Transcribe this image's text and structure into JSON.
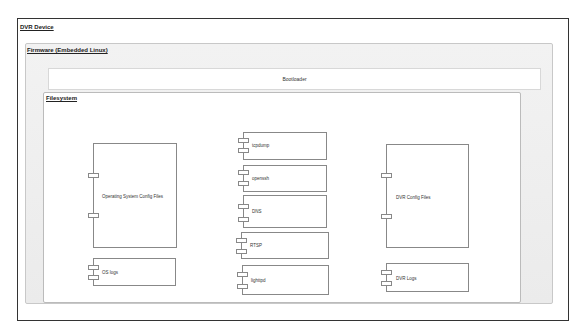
{
  "diagram": {
    "type": "UML component/deployment diagram",
    "device": {
      "label": "DVR Device"
    },
    "firmware": {
      "label": "Firmware (Embedded Linux)"
    },
    "bootloader": {
      "label": "Bootloader"
    },
    "filesystem": {
      "label": "Filesystem",
      "components": [
        {
          "id": "os_config",
          "label": "Operating System Config Files"
        },
        {
          "id": "os_logs",
          "label": "OS logs"
        },
        {
          "id": "tcpdump",
          "label": "tcpdump"
        },
        {
          "id": "openssh",
          "label": "openssh"
        },
        {
          "id": "dns",
          "label": "DNS"
        },
        {
          "id": "rtsp",
          "label": "RTSP"
        },
        {
          "id": "lighttpd",
          "label": "lighttpd"
        },
        {
          "id": "dvr_config",
          "label": "DVR Config Files"
        },
        {
          "id": "dvr_logs",
          "label": "DVR Logs"
        }
      ]
    }
  }
}
